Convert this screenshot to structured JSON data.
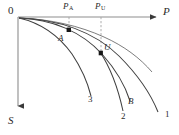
{
  "figure": {
    "type": "thermodynamic-diagram",
    "background": "#ffffff",
    "stroke_color": "#3a3a3a",
    "dash_color": "#9a9a9a",
    "marker_color": "#1a1a1a"
  },
  "axes": {
    "x": {
      "label": "P",
      "direction": "right",
      "arrow": true,
      "origin_px": [
        18,
        17
      ],
      "end_px": [
        160,
        17
      ]
    },
    "y": {
      "label": "S",
      "direction": "down",
      "arrow": true,
      "origin_px": [
        18,
        17
      ],
      "end_px": [
        18,
        111
      ]
    },
    "origin_label": "0"
  },
  "tick_labels": [
    {
      "text": "P",
      "sub": "A",
      "x_px": 66,
      "y_px": 2
    },
    {
      "text": "P",
      "sub": "U",
      "x_px": 97,
      "y_px": 2
    }
  ],
  "droplines": [
    {
      "from_label": "P_A",
      "x_px": 69,
      "y_top_px": 17,
      "y_bottom_px": 30,
      "style": "dashed"
    },
    {
      "from_label": "P_U",
      "x_px": 101,
      "y_top_px": 17,
      "y_bottom_px": 53,
      "style": "dashed"
    }
  ],
  "points": [
    {
      "name": "A",
      "label": "A",
      "x_px": 69,
      "y_px": 30,
      "marker": "filled-square",
      "label_x_px": 60,
      "label_y_px": 34
    },
    {
      "name": "U",
      "label": "U",
      "x_px": 101,
      "y_px": 53,
      "marker": "filled-square",
      "label_x_px": 105,
      "label_y_px": 44
    }
  ],
  "curves": [
    {
      "id": "curve-1",
      "label": "1",
      "label_x_px": 166,
      "label_y_px": 116,
      "path": "M 19,18 C 55,20 92,31 118,55 C 140,75 152,96 158,113",
      "description": "outermost curve ending far right"
    },
    {
      "id": "curve-2",
      "label": "2",
      "label_x_px": 126,
      "label_y_px": 119,
      "path": "M 19,18 C 50,20 79,29 96,46 C 111,62 119,86 124,110",
      "description": "middle curve passing through point U"
    },
    {
      "id": "curve-3",
      "label": "3",
      "label_x_px": 90,
      "label_y_px": 99,
      "path": "M 19,18 C 40,22 58,34 71,52 C 82,68 88,84 91,96",
      "description": "innermost steep curve"
    },
    {
      "id": "curve-B",
      "label": "B",
      "label_x_px": 130,
      "label_y_px": 106,
      "path": "M 19,18 C 52,20 82,32 103,55 C 118,72 126,89 130,102",
      "description": "curve labeled B through point U region"
    }
  ],
  "curve_labels": [
    {
      "text": "3",
      "style": "upright",
      "x_px": 90,
      "y_px": 99
    },
    {
      "text": "B",
      "style": "italic",
      "x_px": 130,
      "y_px": 100
    },
    {
      "text": "2",
      "style": "upright",
      "x_px": 123,
      "y_px": 115
    },
    {
      "text": "1",
      "style": "upright",
      "x_px": 166,
      "y_px": 113
    }
  ]
}
